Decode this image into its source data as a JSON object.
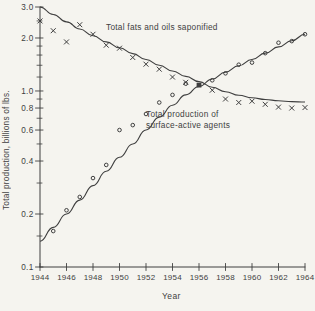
{
  "figure": {
    "background": "#f5f4ef",
    "ink_color": "#3f3f3f",
    "y_axis_label": "Total production, billions of lbs.",
    "x_axis_label": "Year",
    "series1_label": "Total fats and oils saponified",
    "series2_label": "Total production of\nsurface-active agents"
  },
  "chart_data": {
    "type": "line",
    "title": "",
    "xlabel": "Year",
    "ylabel": "Total production, billions of lbs.",
    "y_scale": "log",
    "grid": false,
    "legend_position": "inline-annotations",
    "xlim": [
      1944,
      1964
    ],
    "ylim": [
      0.1,
      3.0
    ],
    "x_ticks": [
      1944,
      1946,
      1948,
      1950,
      1952,
      1954,
      1956,
      1958,
      1960,
      1962,
      1964
    ],
    "x_tick_labels": [
      "1944",
      "1946",
      "1948",
      "1950",
      "1952",
      "1954",
      "1956",
      "1958",
      "1960",
      "1962",
      "1964"
    ],
    "y_ticks_major": [
      3.0,
      2.0,
      1.0,
      0.8,
      0.6,
      0.4,
      0.2,
      0.1
    ],
    "y_tick_labels": [
      "3.0",
      "2.0",
      "1.0",
      "0.8",
      "0.6",
      "0.4",
      "0.2",
      "0.1"
    ],
    "y_ticks_minor": [
      2.5,
      1.8,
      1.6,
      1.4,
      1.2,
      0.9,
      0.7,
      0.5,
      0.3,
      0.15
    ],
    "years": [
      1944,
      1945,
      1946,
      1947,
      1948,
      1949,
      1950,
      1951,
      1952,
      1953,
      1954,
      1955,
      1956,
      1957,
      1958,
      1959,
      1960,
      1961,
      1962,
      1963,
      1964
    ],
    "series": [
      {
        "name": "Total fats and oils saponified",
        "marker": "x",
        "curve": [
          3.0,
          2.72,
          2.47,
          2.25,
          2.06,
          1.9,
          1.76,
          1.63,
          1.51,
          1.4,
          1.3,
          1.21,
          1.13,
          1.05,
          0.99,
          0.945,
          0.915,
          0.895,
          0.88,
          0.87,
          0.865
        ],
        "points": [
          2.5,
          2.2,
          1.9,
          2.38,
          2.1,
          1.82,
          1.75,
          1.55,
          1.42,
          1.33,
          1.2,
          1.12,
          null,
          1.01,
          0.9,
          0.86,
          0.875,
          0.84,
          0.81,
          0.8,
          0.805
        ]
      },
      {
        "name": "Total production of surface-active agents",
        "marker": "circle",
        "curve": [
          0.14,
          0.168,
          0.2,
          0.24,
          0.29,
          0.35,
          0.42,
          0.5,
          0.6,
          0.71,
          0.83,
          0.95,
          1.06,
          1.17,
          1.28,
          1.39,
          1.51,
          1.64,
          1.78,
          1.93,
          2.1
        ],
        "points": [
          null,
          0.16,
          0.21,
          0.25,
          0.32,
          0.38,
          0.6,
          0.64,
          0.74,
          0.86,
          0.95,
          1.1,
          null,
          1.15,
          1.26,
          1.41,
          1.45,
          1.64,
          1.88,
          1.92,
          2.1
        ]
      }
    ],
    "overlap_marker": {
      "year": 1956,
      "value": 1.08,
      "shape": "filled-square"
    }
  }
}
